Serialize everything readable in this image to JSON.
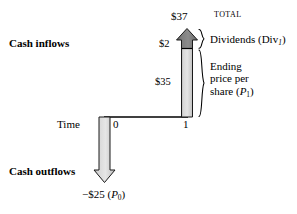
{
  "diagram": {
    "title_total": "TOTAL",
    "labels": {
      "cash_inflows": "Cash inflows",
      "cash_outflows": "Cash outflows",
      "time": "Time",
      "total_value": "$37",
      "dividend_value": "$2",
      "ending_price_value": "$35",
      "outflow_value_prefix": "−$25 (",
      "outflow_value_symbol": "P",
      "outflow_value_sub": "0",
      "outflow_value_suffix": ")",
      "tick_0": "0",
      "tick_1": "1"
    },
    "brace_labels": {
      "dividends_text": "Dividends (Div",
      "dividends_sub": "1",
      "dividends_close": ")",
      "ending_line1": "Ending",
      "ending_line2": "price per",
      "ending_line3_text": "share (",
      "ending_line3_symbol": "P",
      "ending_line3_sub": "1",
      "ending_line3_close": ")"
    },
    "colors": {
      "stroke": "#000000",
      "dividend_fill_dark": "#6e6e6e",
      "dividend_fill_light": "#8f8f8f",
      "price_fill_light": "#dcdcdc",
      "price_fill_mid": "#c4c4c4",
      "outflow_fill": "#d6d6d6",
      "background": "#ffffff"
    },
    "geometry": {
      "timeline_y": 117,
      "tick0_x": 104,
      "tick1_x": 186,
      "inflow_arrow_top_y": 29,
      "divider_y": 48,
      "outflow_arrow_bottom_y": 182
    }
  }
}
